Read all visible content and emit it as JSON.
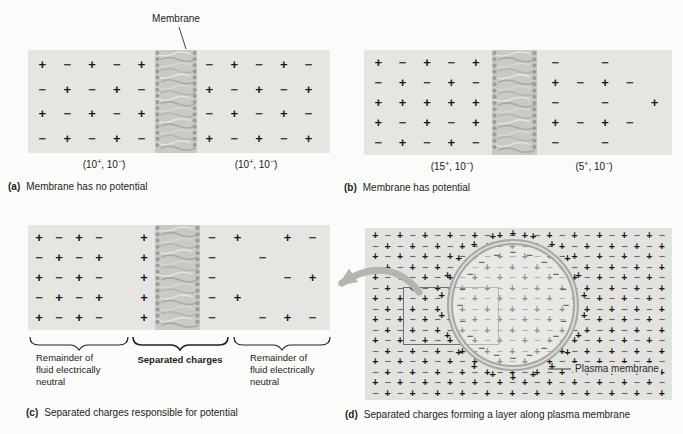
{
  "figure": {
    "membrane_callout": "Membrane",
    "captions": {
      "a": {
        "tag": "(a)",
        "text": "Membrane has no potential"
      },
      "b": {
        "tag": "(b)",
        "text": "Membrane has potential"
      },
      "c": {
        "tag": "(c)",
        "text": "Separated charges responsible for potential"
      },
      "d": {
        "tag": "(d)",
        "text": "Separated charges forming a layer along plasma membrane"
      }
    },
    "colors": {
      "panel_bg": "#e5e5e2",
      "membrane_gray": "#c9c9c5",
      "ring_gray": "#a8a8a4",
      "plus": "#161616",
      "minus": "#3f3f3d",
      "minus_field": "#6b6b67"
    }
  },
  "panel_a": {
    "left_grid": [
      "+−+−+",
      "−+−+−",
      "+−+−+",
      "−+−+−"
    ],
    "right_grid": [
      "−+−+−",
      "+−+−+",
      "−+−+−",
      "+−+−+"
    ],
    "left_count": "(10^+, 10^−)",
    "right_count": "(10^+, 10^−)"
  },
  "panel_b": {
    "left_grid": [
      "+−+−+",
      "−+−+−",
      "+++++",
      "+−+−+",
      "−+−+−"
    ],
    "right_grid": [
      "−.−..",
      "+−+−.",
      "−.−.+",
      "+−+−.",
      "−.−.."
    ],
    "left_count": "(15^+, 10^−)",
    "right_count": "(5^+, 10^−)"
  },
  "panel_c": {
    "left_grid": [
      "+−+−",
      "−+−+",
      "+−+−",
      "−+−+",
      "+−+−"
    ],
    "plus_column": [
      "+",
      "+",
      "+",
      "+",
      "+"
    ],
    "minus_column": [
      "−",
      "−",
      "−",
      "−",
      "−"
    ],
    "right_grid": [
      "+.+−",
      ".−..",
      "..−+",
      "+...",
      ".−+−"
    ],
    "brace_labels": {
      "left": "Remainder of\nfluid electrically\nneutral",
      "middle": "Separated charges",
      "right": "Remainder of\nfluid electrically\nneutral"
    }
  },
  "panel_d": {
    "field_rows": [
      "+−+−+−+−+−+−+−+−+−+−+−+−",
      "−+−+−+−+−+−+−+−+−+−+−+−+",
      "+−+−+−+−+−+−+−+−+−+−+−+−",
      "−+−+−+−+−+−+−+−+−+−+−+−+",
      "+−+−+−+−+−+−+−+−+−+−+−+−",
      "−+−+−+−+−+−+−+−+−+−+−+−+",
      "+−+−+−+−+−+−+−+−+−+−+−+−",
      "−+−+−+−+−+−+−+−+−+−+−+−+",
      "+−+−+−+−+−+−+−+−+−+−+−+−",
      "−+−+−+−+−+−+−+−+−+−+−+−+",
      "+−+−+−+−+−+−+−+−+−+−+−+−",
      "−+−+−+−+−+−+−+−+−+−+−+−+",
      "+−+−+−+−+−+−+−+−+−+−+−+−",
      "−+−+−+−+−+−+−+−+−+−+−+−+",
      "+−+−+−+−+−+−+−+−+−+−+−+−",
      "−+−+−+−+−+−+−+−+−+−+−+−+"
    ],
    "outer_ring_charge": "+",
    "outer_ring_count": 22,
    "inner_ring_charge": "−",
    "inner_ring_count": 20,
    "plasma_label": "Plasma membrane"
  }
}
